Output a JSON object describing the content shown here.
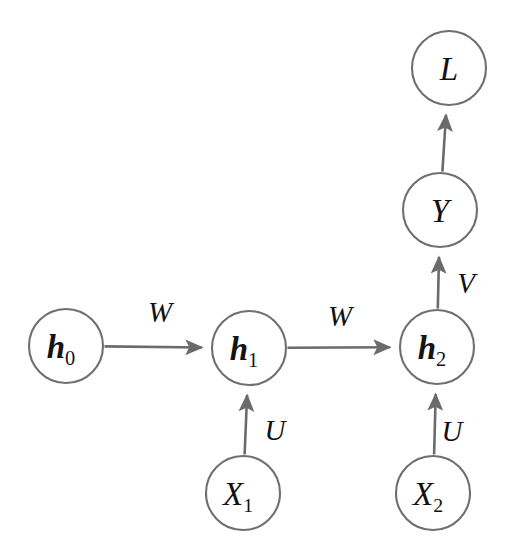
{
  "diagram": {
    "type": "directed-graph",
    "background_color": "#ffffff",
    "node_stroke_color": "#6f6f6f",
    "edge_color": "#6b6b6b",
    "label_color": "#111111",
    "nodes": [
      {
        "id": "h0",
        "base": "h",
        "sub": "0",
        "cx": 66,
        "cy": 346,
        "r": 37,
        "style": "bold-italic"
      },
      {
        "id": "h1",
        "base": "h",
        "sub": "1",
        "cx": 249,
        "cy": 348,
        "r": 37,
        "style": "bold-italic"
      },
      {
        "id": "h2",
        "base": "h",
        "sub": "2",
        "cx": 437,
        "cy": 347,
        "r": 37,
        "style": "bold-italic"
      },
      {
        "id": "x1",
        "base": "X",
        "sub": "1",
        "cx": 243,
        "cy": 493,
        "r": 37,
        "style": "italic"
      },
      {
        "id": "x2",
        "base": "X",
        "sub": "2",
        "cx": 433,
        "cy": 493,
        "r": 37,
        "style": "italic"
      },
      {
        "id": "y",
        "base": "Y",
        "sub": "",
        "cx": 440,
        "cy": 210,
        "r": 37,
        "style": "italic"
      },
      {
        "id": "l",
        "base": "L",
        "sub": "",
        "cx": 449,
        "cy": 68,
        "r": 37,
        "style": "italic"
      }
    ],
    "edges": [
      {
        "from": "h0",
        "to": "h1",
        "label": "W",
        "label_x": 160,
        "label_y": 322
      },
      {
        "from": "h1",
        "to": "h2",
        "label": "W",
        "label_x": 340,
        "label_y": 326
      },
      {
        "from": "x1",
        "to": "h1",
        "label": "U",
        "label_x": 275,
        "label_y": 440
      },
      {
        "from": "x2",
        "to": "h2",
        "label": "U",
        "label_x": 452,
        "label_y": 441
      },
      {
        "from": "h2",
        "to": "y",
        "label": "V",
        "label_x": 466,
        "label_y": 293
      },
      {
        "from": "y",
        "to": "l",
        "label": "",
        "label_x": 0,
        "label_y": 0
      }
    ],
    "edge_labels": [
      {
        "name": "W",
        "text": "W"
      },
      {
        "name": "U",
        "text": "U"
      },
      {
        "name": "V",
        "text": "V"
      }
    ]
  }
}
